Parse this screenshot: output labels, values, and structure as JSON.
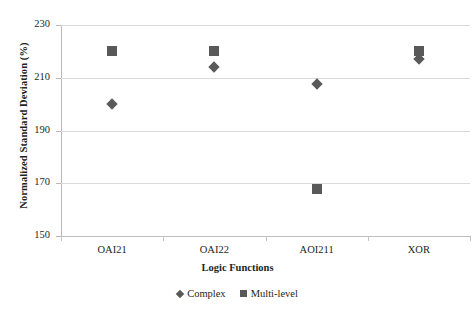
{
  "chart_data": {
    "type": "scatter",
    "title": "",
    "xlabel": "Logic Functions",
    "ylabel": "Normalized Standard Deviation (%)",
    "categories": [
      "OAI21",
      "OAI22",
      "AOI211",
      "XOR"
    ],
    "ylim": [
      150,
      230
    ],
    "yticks": [
      150,
      170,
      190,
      210,
      230
    ],
    "grid": "horizontal",
    "legend_position": "bottom",
    "series": [
      {
        "name": "Complex",
        "marker": "diamond",
        "color": "#595959",
        "values": [
          200,
          214,
          207.5,
          217
        ]
      },
      {
        "name": "Multi-level",
        "marker": "square",
        "color": "#595959",
        "values": [
          220,
          220,
          168,
          220
        ]
      }
    ]
  },
  "legend": {
    "items": [
      {
        "label": "Complex",
        "marker": "diamond-icon"
      },
      {
        "label": "Multi-level",
        "marker": "square-icon"
      }
    ]
  },
  "colors": {
    "marker": "#595959",
    "grid": "#d9d9d9",
    "axis": "#b9b9b9",
    "text": "#231f20",
    "background": "#ffffff"
  }
}
